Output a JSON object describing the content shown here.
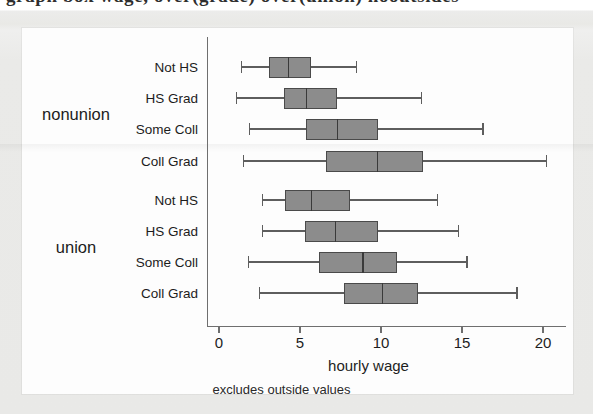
{
  "page": {
    "cut_off_heading": "graph box wage, over(grade) over(union) nooutsides"
  },
  "chart_data": {
    "type": "box",
    "title": "",
    "xlabel": "hourly wage",
    "ylabel": "",
    "note": "excludes outside values",
    "xlim": [
      0,
      22
    ],
    "xticks": [
      0,
      5,
      10,
      15,
      20
    ],
    "xticklabels": [
      "0",
      "5",
      "10",
      "15",
      "20"
    ],
    "grid": false,
    "legend": "none",
    "orientation": "horizontal",
    "box_color": "#8c8c8c",
    "line_color": "#4a4a4a",
    "groups": [
      {
        "name": "nonunion",
        "boxes": [
          {
            "label": "Not HS",
            "lower_whisker": 1.4,
            "q1": 3.1,
            "median": 4.3,
            "q3": 5.7,
            "upper_whisker": 8.5
          },
          {
            "label": "HS Grad",
            "lower_whisker": 1.1,
            "q1": 4.0,
            "median": 5.4,
            "q3": 7.3,
            "upper_whisker": 12.5
          },
          {
            "label": "Some Coll",
            "lower_whisker": 1.9,
            "q1": 5.4,
            "median": 7.3,
            "q3": 9.8,
            "upper_whisker": 16.3
          },
          {
            "label": "Coll Grad",
            "lower_whisker": 1.5,
            "q1": 6.6,
            "median": 9.8,
            "q3": 12.6,
            "upper_whisker": 20.2
          }
        ]
      },
      {
        "name": "union",
        "boxes": [
          {
            "label": "Not HS",
            "lower_whisker": 2.7,
            "q1": 4.1,
            "median": 5.7,
            "q3": 8.1,
            "upper_whisker": 13.5
          },
          {
            "label": "HS Grad",
            "lower_whisker": 2.7,
            "q1": 5.3,
            "median": 7.2,
            "q3": 9.8,
            "upper_whisker": 14.8
          },
          {
            "label": "Some Coll",
            "lower_whisker": 1.8,
            "q1": 6.2,
            "median": 8.9,
            "q3": 11.0,
            "upper_whisker": 15.3
          },
          {
            "label": "Coll Grad",
            "lower_whisker": 2.5,
            "q1": 7.7,
            "median": 10.1,
            "q3": 12.3,
            "upper_whisker": 18.4
          }
        ]
      }
    ]
  }
}
